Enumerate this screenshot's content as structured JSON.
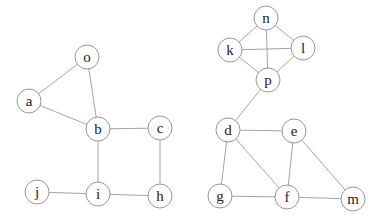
{
  "diagram": {
    "type": "undirected-graph",
    "node_radius": 12,
    "colors": {
      "edge": "#9a9a9a",
      "node_stroke": "#8a8a8a",
      "node_fill": "#ffffff",
      "label": "#222222"
    },
    "nodes": [
      {
        "id": "o",
        "label": "o",
        "x": 87,
        "y": 57
      },
      {
        "id": "a",
        "label": "a",
        "x": 29,
        "y": 101
      },
      {
        "id": "b",
        "label": "b",
        "x": 98,
        "y": 129
      },
      {
        "id": "c",
        "label": "c",
        "x": 160,
        "y": 128
      },
      {
        "id": "j",
        "label": "j",
        "x": 37,
        "y": 192
      },
      {
        "id": "i",
        "label": "i",
        "x": 98,
        "y": 194
      },
      {
        "id": "h",
        "label": "h",
        "x": 160,
        "y": 196
      },
      {
        "id": "n",
        "label": "n",
        "x": 266,
        "y": 18
      },
      {
        "id": "k",
        "label": "k",
        "x": 230,
        "y": 50
      },
      {
        "id": "l",
        "label": "l",
        "x": 303,
        "y": 48
      },
      {
        "id": "p",
        "label": "p",
        "x": 268,
        "y": 80
      },
      {
        "id": "d",
        "label": "d",
        "x": 228,
        "y": 130
      },
      {
        "id": "e",
        "label": "e",
        "x": 294,
        "y": 131
      },
      {
        "id": "g",
        "label": "g",
        "x": 220,
        "y": 196
      },
      {
        "id": "f",
        "label": "f",
        "x": 287,
        "y": 197
      },
      {
        "id": "m",
        "label": "m",
        "x": 353,
        "y": 199
      }
    ],
    "edges": [
      [
        "o",
        "a"
      ],
      [
        "o",
        "b"
      ],
      [
        "a",
        "b"
      ],
      [
        "b",
        "c"
      ],
      [
        "b",
        "i"
      ],
      [
        "c",
        "h"
      ],
      [
        "i",
        "h"
      ],
      [
        "j",
        "i"
      ],
      [
        "n",
        "k"
      ],
      [
        "n",
        "l"
      ],
      [
        "n",
        "p"
      ],
      [
        "k",
        "l"
      ],
      [
        "k",
        "p"
      ],
      [
        "l",
        "p"
      ],
      [
        "p",
        "d"
      ],
      [
        "d",
        "e"
      ],
      [
        "d",
        "g"
      ],
      [
        "d",
        "f"
      ],
      [
        "e",
        "f"
      ],
      [
        "e",
        "m"
      ],
      [
        "g",
        "f"
      ],
      [
        "f",
        "m"
      ]
    ]
  }
}
